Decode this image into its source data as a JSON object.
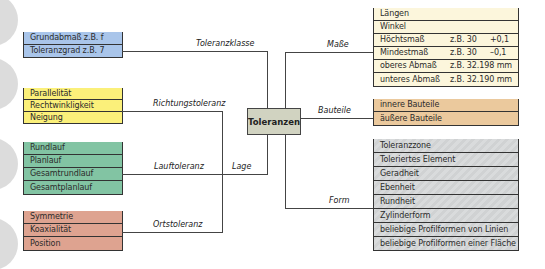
{
  "center": {
    "label": "Toleranzen",
    "color": "#d1d3c1"
  },
  "left_groups": [
    {
      "connector_label": "Toleranzklasse",
      "color": "#a9c5ea",
      "items": [
        "Grundabmaß z.B. f",
        "Toleranzgrad z.B. 7"
      ]
    },
    {
      "connector_label": "Richtungstoleranz",
      "color": "#fbf07a",
      "items": [
        "Parallelität",
        "Rechtwinkligkeit",
        "Neigung"
      ]
    },
    {
      "connector_label": "Lauftoleranz",
      "color": "#82c4a3",
      "items": [
        "Rundlauf",
        "Planlauf",
        "Gesamtrundlauf",
        "Gesamtplanlauf"
      ]
    },
    {
      "connector_label": "Ortstoleranz",
      "color": "#dea390",
      "items": [
        "Symmetrie",
        "Koaxialität",
        "Position"
      ]
    }
  ],
  "lage_label": "Lage",
  "right_groups": [
    {
      "connector_label": "Maße",
      "color": "#fcf6dc",
      "items": [
        {
          "name": "Längen",
          "example": "",
          "value": ""
        },
        {
          "name": "Winkel",
          "example": "",
          "value": ""
        },
        {
          "name": "Höchtsmaß",
          "example": "z.B. 30",
          "value": "+0,1"
        },
        {
          "name": "Mindestmaß",
          "example": "z.B. 30",
          "value": "–0,1"
        },
        {
          "name": "oberes Abmaß",
          "example": "z.B. 32.198 mm",
          "value": ""
        },
        {
          "name": "unteres Abmaß",
          "example": "z.B. 32.190 mm",
          "value": ""
        }
      ]
    },
    {
      "connector_label": "Bauteile",
      "color": "#ebc99d",
      "items": [
        "innere Bauteile",
        "äußere Bauteile"
      ]
    },
    {
      "connector_label": "Form",
      "color": "#d5d7d8",
      "items": [
        "Toleranzzone",
        "Toleriertes Element",
        "Geradheit",
        "Ebenheit",
        "Rundheit",
        "Zylinderform",
        "beliebige Profilformen von Linien",
        "beliebige Profilformen einer Fläche"
      ]
    }
  ]
}
